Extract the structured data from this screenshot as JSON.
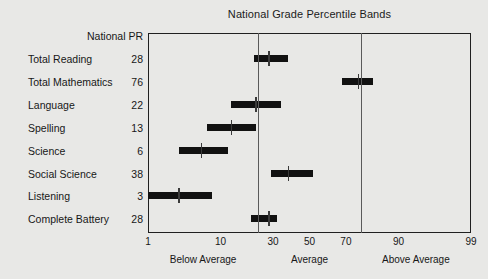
{
  "chart_data": {
    "type": "bar",
    "title": "National Grade Percentile Bands",
    "xlabel": "",
    "ylabel": "",
    "xlim": [
      1,
      99
    ],
    "grid": false,
    "legend": null,
    "value_column_header": "National PR",
    "categories": [
      "Total Reading",
      "Total Mathematics",
      "Language",
      "Spelling",
      "Science",
      "Social Science",
      "Listening",
      "Complete Battery"
    ],
    "values": [
      28,
      76,
      22,
      13,
      6,
      38,
      3,
      28
    ],
    "bands": [
      {
        "label": "Total Reading",
        "national_pr": 28,
        "band_low": 21,
        "band_high": 38,
        "marker": 28
      },
      {
        "label": "Total Mathematics",
        "national_pr": 76,
        "band_low": 68,
        "band_high": 82,
        "marker": 76
      },
      {
        "label": "Language",
        "national_pr": 22,
        "band_low": 13,
        "band_high": 34,
        "marker": 22
      },
      {
        "label": "Spelling",
        "national_pr": 13,
        "band_low": 7,
        "band_high": 22,
        "marker": 13
      },
      {
        "label": "Science",
        "national_pr": 6,
        "band_low": 3,
        "band_high": 12,
        "marker": 6
      },
      {
        "label": "Social Science",
        "national_pr": 38,
        "band_low": 29,
        "band_high": 52,
        "marker": 38
      },
      {
        "label": "Listening",
        "national_pr": 3,
        "band_low": 1,
        "band_high": 8,
        "marker": 3
      },
      {
        "label": "Complete Battery",
        "national_pr": 28,
        "band_low": 20,
        "band_high": 32,
        "marker": 28
      }
    ],
    "x_ticks": [
      {
        "value": 1,
        "label": "1"
      },
      {
        "value": 10,
        "label": "10"
      },
      {
        "value": 30,
        "label": "30"
      },
      {
        "value": 50,
        "label": "50"
      },
      {
        "value": 70,
        "label": "70"
      },
      {
        "value": 90,
        "label": "90"
      },
      {
        "value": 99,
        "label": "99"
      }
    ],
    "zones": [
      {
        "label": "Below Average",
        "from": 1,
        "to": 23
      },
      {
        "label": "Average",
        "from": 23,
        "to": 77
      },
      {
        "label": "Above Average",
        "from": 77,
        "to": 99
      }
    ],
    "zone_dividers": [
      23,
      77
    ],
    "colors": {
      "background": "#e8e8e6",
      "band": "#111111",
      "marker": "#3a3a3a",
      "frame": "#202020",
      "divider": "#5a5a5a",
      "text": "#171717"
    }
  }
}
